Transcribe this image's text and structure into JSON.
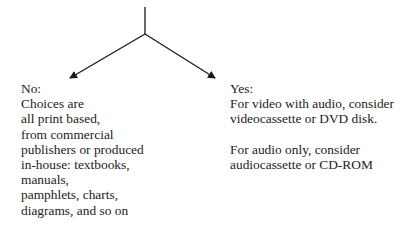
{
  "diagram": {
    "type": "decision-branch",
    "stroke_color": "#1a1a1a",
    "branches": [
      {
        "label": "No:",
        "lines": [
          "Choices are",
          "all print based,",
          "from commercial",
          "publishers or produced",
          "in-house: textbooks,",
          "manuals,",
          "pamphlets, charts,",
          "diagrams, and so on"
        ]
      },
      {
        "label": "Yes:",
        "paragraphs": [
          [
            "For video with audio, consider",
            "videocassette or DVD disk."
          ],
          [
            "For audio only, consider",
            "audiocassette or CD-ROM"
          ]
        ]
      }
    ]
  }
}
